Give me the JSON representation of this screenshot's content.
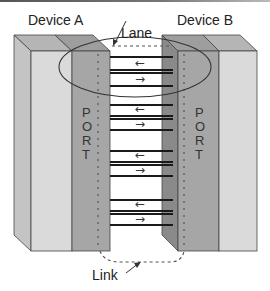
{
  "diagram": {
    "labels": {
      "device_a": "Device A",
      "device_b": "Device B",
      "lane": "Lane",
      "link": "Link"
    },
    "ports": {
      "left": [
        "P",
        "O",
        "R",
        "T"
      ],
      "right": [
        "P",
        "O",
        "R",
        "T"
      ]
    },
    "lanes": [
      {
        "direction_top": "←",
        "direction_bottom": "→"
      },
      {
        "direction_top": "←",
        "direction_bottom": "→"
      },
      {
        "direction_top": "←",
        "direction_bottom": "→"
      },
      {
        "direction_top": "←",
        "direction_bottom": "→"
      }
    ],
    "colors": {
      "device_face": "#d9d9d9",
      "device_side": "#bdbdbd",
      "device_top": "#a8a8a8",
      "port_face": "#a3a3a3",
      "port_side": "#8c8c8c",
      "port_top": "#9a9a9a",
      "wire": "#1a1a1a",
      "outline": "#333333"
    }
  }
}
